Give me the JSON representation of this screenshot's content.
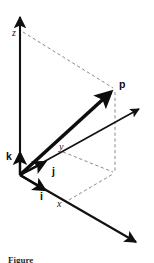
{
  "figure": {
    "type": "3d-vector-diagram",
    "caption_partial": "Figure",
    "background_color": "#ffffff",
    "stroke_color": "#111111",
    "dash_color": "#8a8a8a"
  },
  "axes": {
    "z": {
      "label": "z",
      "style": "italic",
      "origin": [
        20,
        175
      ],
      "tip": [
        20,
        12
      ],
      "label_pos": [
        12,
        36
      ]
    },
    "y": {
      "label": "y",
      "style": "italic",
      "origin": [
        20,
        175
      ],
      "tip": [
        144,
        106
      ],
      "label_pos": [
        60,
        149
      ]
    },
    "x": {
      "label": "x",
      "style": "italic",
      "origin": [
        20,
        175
      ],
      "tip": [
        141,
        246
      ],
      "label_pos": [
        58,
        206
      ]
    }
  },
  "vectors": {
    "p": {
      "label": "p",
      "style": "bold",
      "origin": [
        20,
        175
      ],
      "tip": [
        115,
        88
      ],
      "label_pos": [
        121,
        86
      ],
      "stroke_width": 3.4
    },
    "i": {
      "label": "i",
      "style": "bold",
      "origin": [
        20,
        175
      ],
      "tip": [
        49,
        192
      ],
      "label_pos": [
        41,
        199
      ],
      "stroke_width": 2.6
    },
    "j": {
      "label": "j",
      "style": "bold",
      "origin": [
        20,
        175
      ],
      "tip": [
        48,
        159
      ],
      "label_pos": [
        53,
        172
      ],
      "stroke_width": 2.6
    },
    "k": {
      "label": "k",
      "style": "bold",
      "origin": [
        20,
        175
      ],
      "tip": [
        20,
        148
      ],
      "label_pos": [
        7,
        157
      ],
      "stroke_width": 2.6
    }
  },
  "construction_lines": [
    {
      "name": "z-to-p-top",
      "from": [
        22,
        32
      ],
      "to": [
        114,
        89
      ]
    },
    {
      "name": "p-vertical-drop",
      "from": [
        115,
        90
      ],
      "to": [
        115,
        173
      ]
    },
    {
      "name": "y-foot-to-base",
      "from": [
        62,
        152
      ],
      "to": [
        114,
        172
      ]
    },
    {
      "name": "x-foot-to-base",
      "from": [
        68,
        200
      ],
      "to": [
        114,
        173
      ]
    }
  ],
  "colors": {
    "ink": "#111111",
    "dashed": "#8a8a8a",
    "axis": "#2a2a2a",
    "paper": "#ffffff"
  }
}
